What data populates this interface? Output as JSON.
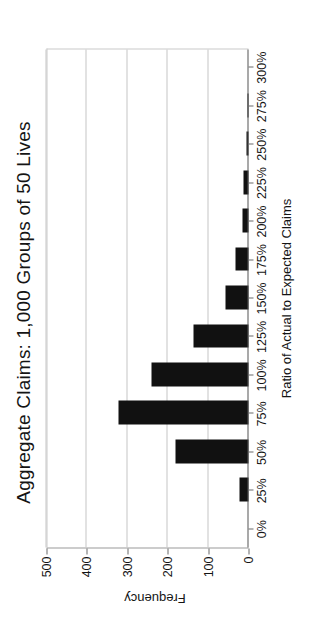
{
  "chart_data": {
    "type": "bar",
    "title": "Aggregate Claims:  1,000 Groups of 50 Lives",
    "xlabel": "Ratio of Actual to Expected Claims",
    "ylabel": "Frequency",
    "categories": [
      "0%",
      "25%",
      "50%",
      "75%",
      "100%",
      "125%",
      "150%",
      "175%",
      "200%",
      "225%",
      "250%",
      "275%",
      "300%"
    ],
    "xticklabels": [
      "0%",
      "25%",
      "50%",
      "75%",
      "100%",
      "125%",
      "150%",
      "175%",
      "200%",
      "225%",
      "250%",
      "275%",
      "300%"
    ],
    "yticklabels": [
      "0",
      "100",
      "200",
      "300",
      "400",
      "500"
    ],
    "ytickvalues": [
      0,
      100,
      200,
      300,
      400,
      500
    ],
    "ylim": [
      0,
      500
    ],
    "grid": true,
    "legend": "none",
    "bar_color": "#111111",
    "bars": [
      {
        "category": "0%",
        "value": 0
      },
      {
        "category": "25%",
        "value": 22
      },
      {
        "category": "50%",
        "value": 181
      },
      {
        "category": "75%",
        "value": 322
      },
      {
        "category": "100%",
        "value": 239
      },
      {
        "category": "125%",
        "value": 137
      },
      {
        "category": "150%",
        "value": 57
      },
      {
        "category": "175%",
        "value": 31
      },
      {
        "category": "200%",
        "value": 14
      },
      {
        "category": "225%",
        "value": 13
      },
      {
        "category": "250%",
        "value": 6
      },
      {
        "category": "275%",
        "value": 3
      },
      {
        "category": "300%",
        "value": 0
      }
    ],
    "values": [
      0,
      22,
      181,
      322,
      239,
      137,
      57,
      31,
      14,
      13,
      6,
      3,
      0
    ]
  }
}
